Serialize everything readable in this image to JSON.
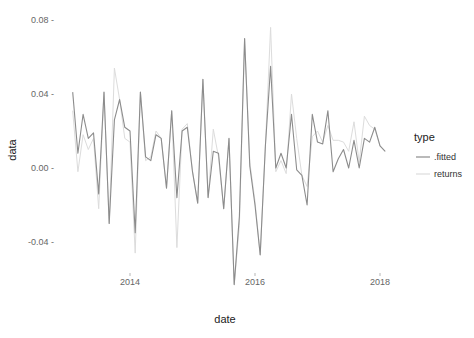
{
  "chart_data": {
    "type": "line",
    "title": "",
    "xlabel": "date",
    "ylabel": "data",
    "x_ticks": [
      "2014",
      "2016",
      "2018"
    ],
    "x_tick_values": [
      2014,
      2016,
      2018
    ],
    "y_ticks": [
      "0.08",
      "0.04",
      "0.00",
      "-0.04"
    ],
    "y_tick_values": [
      0.08,
      0.04,
      0.0,
      -0.04
    ],
    "xlim": [
      2012.9,
      2018.15
    ],
    "ylim": [
      -0.065,
      0.082
    ],
    "grid": false,
    "legend": {
      "title": "type",
      "position": "right",
      "entries": [
        ".fitted",
        "returns"
      ]
    },
    "x_start": 2013.0833,
    "x_step_months": 1,
    "series": [
      {
        "name": ".fitted",
        "color": "#8c8c8c",
        "values": [
          0.041,
          0.008,
          0.029,
          0.016,
          0.019,
          -0.014,
          0.041,
          -0.03,
          0.026,
          0.037,
          0.022,
          0.02,
          -0.035,
          0.041,
          0.006,
          0.004,
          0.018,
          0.016,
          -0.011,
          0.031,
          -0.016,
          0.02,
          0.022,
          -0.002,
          -0.019,
          0.048,
          -0.016,
          0.009,
          0.008,
          -0.022,
          0.016,
          -0.063,
          -0.026,
          0.07,
          0.001,
          -0.02,
          -0.047,
          0.012,
          0.055,
          0.0,
          0.008,
          0.0,
          0.029,
          -0.001,
          -0.004,
          -0.02,
          0.029,
          0.014,
          0.013,
          0.031,
          -0.002,
          0.005,
          0.01,
          0.0,
          0.015,
          0.0,
          0.016,
          0.014,
          0.022,
          0.012,
          0.009
        ]
      },
      {
        "name": "returns",
        "color": "#dcdcdc",
        "values": [
          0.031,
          -0.002,
          0.018,
          0.01,
          0.016,
          -0.022,
          0.041,
          -0.03,
          0.054,
          0.037,
          0.016,
          0.014,
          -0.046,
          0.041,
          0.004,
          0.006,
          0.02,
          0.016,
          -0.011,
          0.031,
          -0.043,
          0.021,
          0.024,
          -0.002,
          -0.019,
          0.048,
          -0.016,
          0.021,
          0.006,
          -0.022,
          0.016,
          -0.063,
          -0.031,
          0.07,
          0.003,
          -0.018,
          -0.047,
          0.012,
          0.076,
          -0.002,
          0.004,
          -0.003,
          0.04,
          0.016,
          -0.004,
          -0.01,
          0.017,
          0.02,
          0.014,
          0.023,
          0.015,
          0.015,
          0.014,
          0.009,
          0.025,
          0.003,
          0.028,
          0.023,
          0.021,
          0.012,
          0.009
        ]
      }
    ]
  }
}
